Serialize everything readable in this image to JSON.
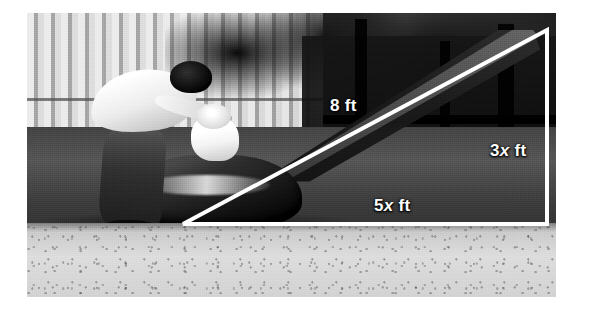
{
  "figure": {
    "type": "photograph-with-geometry-overlay",
    "scene": {
      "subjects": [
        "adult",
        "child",
        "playground-slide"
      ],
      "background_elements": [
        "vertical-slat-fence",
        "foliage",
        "support-posts",
        "gravel-ground"
      ],
      "color_mode": "grayscale"
    }
  },
  "overlay": {
    "shape": "right-triangle",
    "line_color": "#ffffff",
    "line_width_px": 4,
    "vertices": {
      "bottom_left": [
        183,
        224
      ],
      "bottom_right": [
        547,
        224
      ],
      "top_right": [
        547,
        30
      ]
    },
    "labels": {
      "hypotenuse": {
        "number": "8",
        "unit": "ft",
        "variable": ""
      },
      "vertical_leg": {
        "number": "3",
        "unit": "ft",
        "variable": "x"
      },
      "horizontal_leg": {
        "number": "5",
        "unit": "ft",
        "variable": "x"
      }
    }
  },
  "labels": {
    "hypotenuse_text": "8 ft",
    "height_number": "3",
    "height_variable": "x",
    "height_unit": " ft",
    "base_number": "5",
    "base_variable": "x",
    "base_unit": " ft"
  },
  "canvas": {
    "background": "#ffffff",
    "photo_bounds": [
      27,
      13,
      529,
      284
    ]
  }
}
